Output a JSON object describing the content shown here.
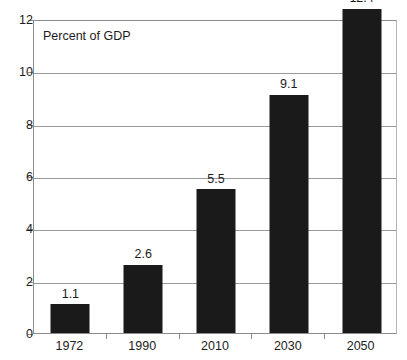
{
  "chart_data": {
    "type": "bar",
    "title": "",
    "annotation": "Percent of GDP",
    "xlabel": "",
    "ylabel": "Percent of GDP",
    "categories": [
      "1972",
      "1990",
      "2010",
      "2030",
      "2050"
    ],
    "values": [
      1.1,
      2.6,
      5.5,
      9.1,
      12.4
    ],
    "value_labels": [
      "1.1",
      "2.6",
      "5.5",
      "9.1",
      "12.4"
    ],
    "ylim": [
      0,
      12
    ],
    "y_ticks": [
      0,
      2,
      4,
      6,
      8,
      10,
      12
    ],
    "y_tick_labels": [
      "0",
      "2",
      "4",
      "6",
      "8",
      "10",
      "12"
    ],
    "grid": true,
    "grid_axis": "y",
    "legend": "none",
    "bar_color": "#1a1a1a",
    "grid_color": "#9a9a9a",
    "axis_color": "#8c8c8c",
    "background_color": "#ffffff",
    "text_color": "#1c1c1c"
  }
}
